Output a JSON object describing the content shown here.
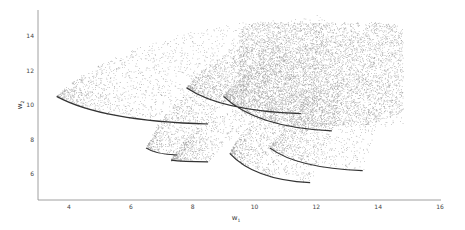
{
  "chart_data": {
    "type": "scatter",
    "title": "",
    "xlabel": "w1",
    "ylabel": "w2",
    "xlabel_main": "w",
    "xlabel_sub": "1",
    "ylabel_main": "w",
    "ylabel_sub": "2",
    "xlim": [
      2.9,
      16
    ],
    "ylim": [
      4.8,
      15.5
    ],
    "xticks": [
      4,
      6,
      8,
      10,
      12,
      14,
      16
    ],
    "yticks": [
      6,
      8,
      10,
      12,
      14
    ],
    "grid": false,
    "legend": null,
    "point_color": "#555555",
    "edge_color": "#333333",
    "crescents": [
      {
        "tip": [
          3.6,
          10.5
        ],
        "top": [
          12.5,
          15.3
        ],
        "bottom": [
          8.5,
          8.9
        ],
        "density": 1600
      },
      {
        "tip": [
          6.5,
          7.5
        ],
        "top": [
          10.0,
          12.2
        ],
        "bottom": [
          7.5,
          7.1
        ],
        "density": 700
      },
      {
        "tip": [
          7.3,
          6.8
        ],
        "top": [
          10.5,
          10.2
        ],
        "bottom": [
          8.5,
          6.7
        ],
        "density": 600
      },
      {
        "tip": [
          9.2,
          7.2
        ],
        "top": [
          13.0,
          11.5
        ],
        "bottom": [
          11.8,
          5.5
        ],
        "density": 1200
      },
      {
        "tip": [
          7.8,
          11.0
        ],
        "top": [
          12.5,
          14.6
        ],
        "bottom": [
          11.5,
          9.5
        ],
        "density": 1300
      },
      {
        "tip": [
          9.0,
          10.5
        ],
        "top": [
          13.5,
          14.0
        ],
        "bottom": [
          12.5,
          8.5
        ],
        "density": 1400
      },
      {
        "tip": [
          10.5,
          7.5
        ],
        "top": [
          14.5,
          12.0
        ],
        "bottom": [
          13.5,
          6.2
        ],
        "density": 900
      }
    ],
    "dense_cloud": {
      "x_range": [
        9.5,
        14.8
      ],
      "y_range": [
        8.8,
        14.8
      ],
      "density": 9000
    }
  }
}
